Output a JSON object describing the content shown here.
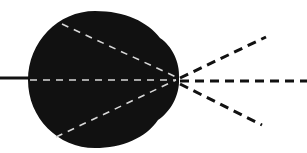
{
  "diagram": {
    "colors": {
      "background": "#ffffff",
      "blob": "#111111",
      "inner_dashes": "#d8d8d8",
      "outer_dashes": "#111111"
    },
    "focal_point": {
      "x": 178,
      "y": 78
    },
    "incoming_line": {
      "x1": 0,
      "y1": 78,
      "x2": 30,
      "y2": 78
    },
    "inner_rays": [
      {
        "x1": 62,
        "y1": 24,
        "x2": 178,
        "y2": 78
      },
      {
        "x1": 30,
        "y1": 78,
        "x2": 178,
        "y2": 78
      },
      {
        "x1": 58,
        "y1": 137,
        "x2": 178,
        "y2": 78
      }
    ],
    "outer_rays": [
      {
        "x1": 178,
        "y1": 78,
        "x2": 266,
        "y2": 37
      },
      {
        "x1": 178,
        "y1": 78,
        "x2": 307,
        "y2": 78
      },
      {
        "x1": 178,
        "y1": 78,
        "x2": 262,
        "y2": 125
      }
    ]
  }
}
